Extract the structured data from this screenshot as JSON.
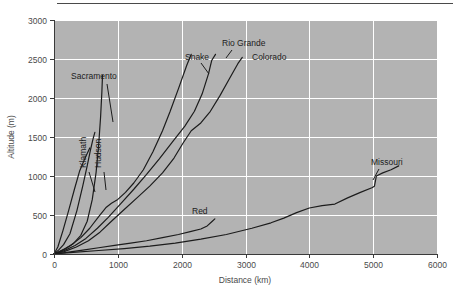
{
  "chart_data": {
    "type": "line",
    "title": "",
    "xlabel": "Distance (km)",
    "ylabel": "Altitude (m)",
    "xlim": [
      0,
      6000
    ],
    "ylim": [
      0,
      3000
    ],
    "xticks": [
      0,
      1000,
      2000,
      3000,
      4000,
      5000,
      6000
    ],
    "yticks": [
      0,
      500,
      1000,
      1500,
      2000,
      2500,
      3000
    ],
    "xtick_labels": [
      "0",
      "1000",
      "2000",
      "3000",
      "4000",
      "5000",
      "6000"
    ],
    "ytick_labels": [
      "0",
      "500",
      "1000",
      "1500",
      "2000",
      "2500",
      "3000"
    ],
    "grid": true,
    "grid_color": "#ffffff",
    "plot_bgcolor": "#b3b3b3",
    "line_color": "#1c1c1c",
    "legend_position": "inline-labels",
    "series": [
      {
        "name": "Klamath",
        "label_x": 2,
        "label_y": 4,
        "points": [
          [
            0,
            0
          ],
          [
            60,
            90
          ],
          [
            140,
            300
          ],
          [
            230,
            560
          ],
          [
            320,
            830
          ],
          [
            400,
            1060
          ],
          [
            470,
            1200
          ],
          [
            520,
            1290
          ],
          [
            560,
            1360
          ]
        ]
      },
      {
        "name": "Hudson",
        "label_x": 3,
        "label_y": 5,
        "points": [
          [
            0,
            0
          ],
          [
            70,
            50
          ],
          [
            150,
            120
          ],
          [
            250,
            260
          ],
          [
            360,
            560
          ],
          [
            450,
            870
          ],
          [
            520,
            1130
          ],
          [
            570,
            1330
          ],
          [
            610,
            1470
          ],
          [
            640,
            1560
          ]
        ]
      },
      {
        "name": "Sacramento",
        "label_x": 4,
        "label_y": 6,
        "points": [
          [
            0,
            0
          ],
          [
            80,
            30
          ],
          [
            180,
            70
          ],
          [
            300,
            130
          ],
          [
            420,
            240
          ],
          [
            520,
            420
          ],
          [
            600,
            700
          ],
          [
            660,
            1050
          ],
          [
            700,
            1400
          ],
          [
            730,
            1760
          ],
          [
            750,
            2080
          ],
          [
            760,
            2290
          ]
        ]
      },
      {
        "name": "Snake",
        "label_x": 5,
        "label_y": 7,
        "points": [
          [
            0,
            0
          ],
          [
            120,
            40
          ],
          [
            260,
            110
          ],
          [
            420,
            210
          ],
          [
            560,
            330
          ],
          [
            700,
            480
          ],
          [
            820,
            600
          ],
          [
            900,
            650
          ],
          [
            1000,
            700
          ],
          [
            1120,
            790
          ],
          [
            1250,
            910
          ],
          [
            1400,
            1080
          ],
          [
            1550,
            1310
          ],
          [
            1700,
            1580
          ],
          [
            1820,
            1830
          ],
          [
            1950,
            2120
          ],
          [
            2080,
            2420
          ],
          [
            2150,
            2560
          ]
        ]
      },
      {
        "name": "Rio Grande",
        "label_x": 6,
        "label_y": 8,
        "points": [
          [
            0,
            0
          ],
          [
            150,
            40
          ],
          [
            330,
            110
          ],
          [
            500,
            200
          ],
          [
            680,
            330
          ],
          [
            850,
            470
          ],
          [
            1050,
            650
          ],
          [
            1250,
            830
          ],
          [
            1450,
            1020
          ],
          [
            1650,
            1220
          ],
          [
            1850,
            1430
          ],
          [
            2050,
            1640
          ],
          [
            2200,
            1830
          ],
          [
            2320,
            2050
          ],
          [
            2420,
            2310
          ],
          [
            2470,
            2480
          ],
          [
            2530,
            2560
          ]
        ]
      },
      {
        "name": "Colorado",
        "label_x": 7,
        "label_y": 9,
        "points": [
          [
            0,
            0
          ],
          [
            160,
            30
          ],
          [
            350,
            90
          ],
          [
            540,
            170
          ],
          [
            720,
            280
          ],
          [
            900,
            420
          ],
          [
            1100,
            570
          ],
          [
            1300,
            720
          ],
          [
            1500,
            870
          ],
          [
            1700,
            1040
          ],
          [
            1880,
            1230
          ],
          [
            2020,
            1420
          ],
          [
            2150,
            1580
          ],
          [
            2300,
            1680
          ],
          [
            2450,
            1830
          ],
          [
            2600,
            2030
          ],
          [
            2750,
            2250
          ],
          [
            2880,
            2440
          ],
          [
            2950,
            2520
          ]
        ]
      },
      {
        "name": "Red",
        "label_x": 8,
        "label_y": 10,
        "points": [
          [
            0,
            0
          ],
          [
            200,
            20
          ],
          [
            450,
            50
          ],
          [
            700,
            80
          ],
          [
            950,
            110
          ],
          [
            1200,
            140
          ],
          [
            1450,
            170
          ],
          [
            1700,
            210
          ],
          [
            1950,
            250
          ],
          [
            2150,
            290
          ],
          [
            2300,
            320
          ],
          [
            2400,
            360
          ],
          [
            2480,
            420
          ],
          [
            2520,
            450
          ]
        ]
      },
      {
        "name": "Missouri",
        "label_x": 9,
        "label_y": 11,
        "points": [
          [
            0,
            0
          ],
          [
            300,
            20
          ],
          [
            700,
            45
          ],
          [
            1100,
            70
          ],
          [
            1500,
            100
          ],
          [
            1900,
            140
          ],
          [
            2300,
            190
          ],
          [
            2700,
            250
          ],
          [
            3100,
            330
          ],
          [
            3400,
            400
          ],
          [
            3600,
            460
          ],
          [
            3800,
            530
          ],
          [
            4000,
            590
          ],
          [
            4200,
            620
          ],
          [
            4400,
            640
          ],
          [
            4600,
            720
          ],
          [
            4800,
            790
          ],
          [
            4980,
            850
          ],
          [
            5020,
            870
          ],
          [
            5050,
            1000
          ],
          [
            5150,
            1040
          ],
          [
            5280,
            1080
          ],
          [
            5400,
            1130
          ]
        ]
      }
    ],
    "annotations": [
      {
        "text": "Klamath",
        "x": 86,
        "y": 168,
        "rotation": -90,
        "anchor": "start"
      },
      {
        "text": "Hudson",
        "x": 101,
        "y": 168,
        "rotation": -90,
        "anchor": "start"
      },
      {
        "text": "Sacramento",
        "x": 71,
        "y": 79,
        "rotation": 0,
        "anchor": "start"
      },
      {
        "text": "Snake",
        "x": 185,
        "y": 60,
        "rotation": 0,
        "anchor": "start"
      },
      {
        "text": "Rio Grande",
        "x": 222,
        "y": 46,
        "rotation": 0,
        "anchor": "start"
      },
      {
        "text": "Colorado",
        "x": 252,
        "y": 60,
        "rotation": 0,
        "anchor": "start"
      },
      {
        "text": "Red",
        "x": 192,
        "y": 214,
        "rotation": 0,
        "anchor": "start"
      },
      {
        "text": "Missouri",
        "x": 371,
        "y": 165,
        "rotation": 0,
        "anchor": "start"
      }
    ],
    "leader_lines": [
      {
        "name": "klamath-leader",
        "x1": 89,
        "y1": 172,
        "x2": 95,
        "y2": 192
      },
      {
        "name": "hudson-leader",
        "x1": 104,
        "y1": 172,
        "x2": 106,
        "y2": 190
      },
      {
        "name": "sacramento-leader",
        "x1": 107,
        "y1": 84,
        "x2": 113,
        "y2": 122
      },
      {
        "name": "snake-leader",
        "x1": 201,
        "y1": 63,
        "x2": 209,
        "y2": 74
      },
      {
        "name": "riogrande-leader",
        "x1": 232,
        "y1": 50,
        "x2": 226,
        "y2": 58
      },
      {
        "name": "missouri-leader",
        "x1": 379,
        "y1": 169,
        "x2": 373,
        "y2": 180
      }
    ]
  }
}
